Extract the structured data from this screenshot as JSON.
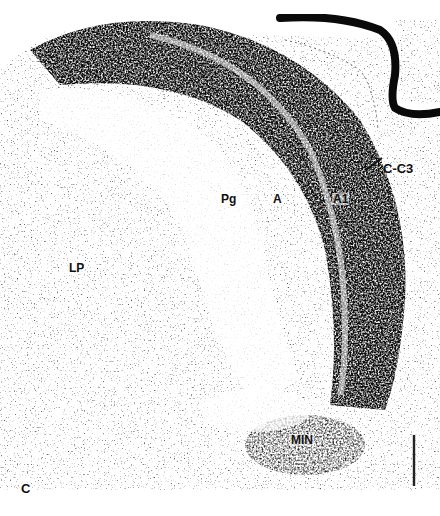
{
  "figure": {
    "panel_letter": "C",
    "labels": {
      "pg": "Pg",
      "a": "A",
      "a1": "A1",
      "c_c3": "C-C3",
      "lp": "LP",
      "min": "MIN"
    },
    "scale_bar": {
      "present": true,
      "orientation": "vertical"
    },
    "colors": {
      "background": "#ffffff",
      "stain_dark": "#141414",
      "stain_mid": "#3a3a3a",
      "stain_light": "#8a8a8a"
    }
  }
}
